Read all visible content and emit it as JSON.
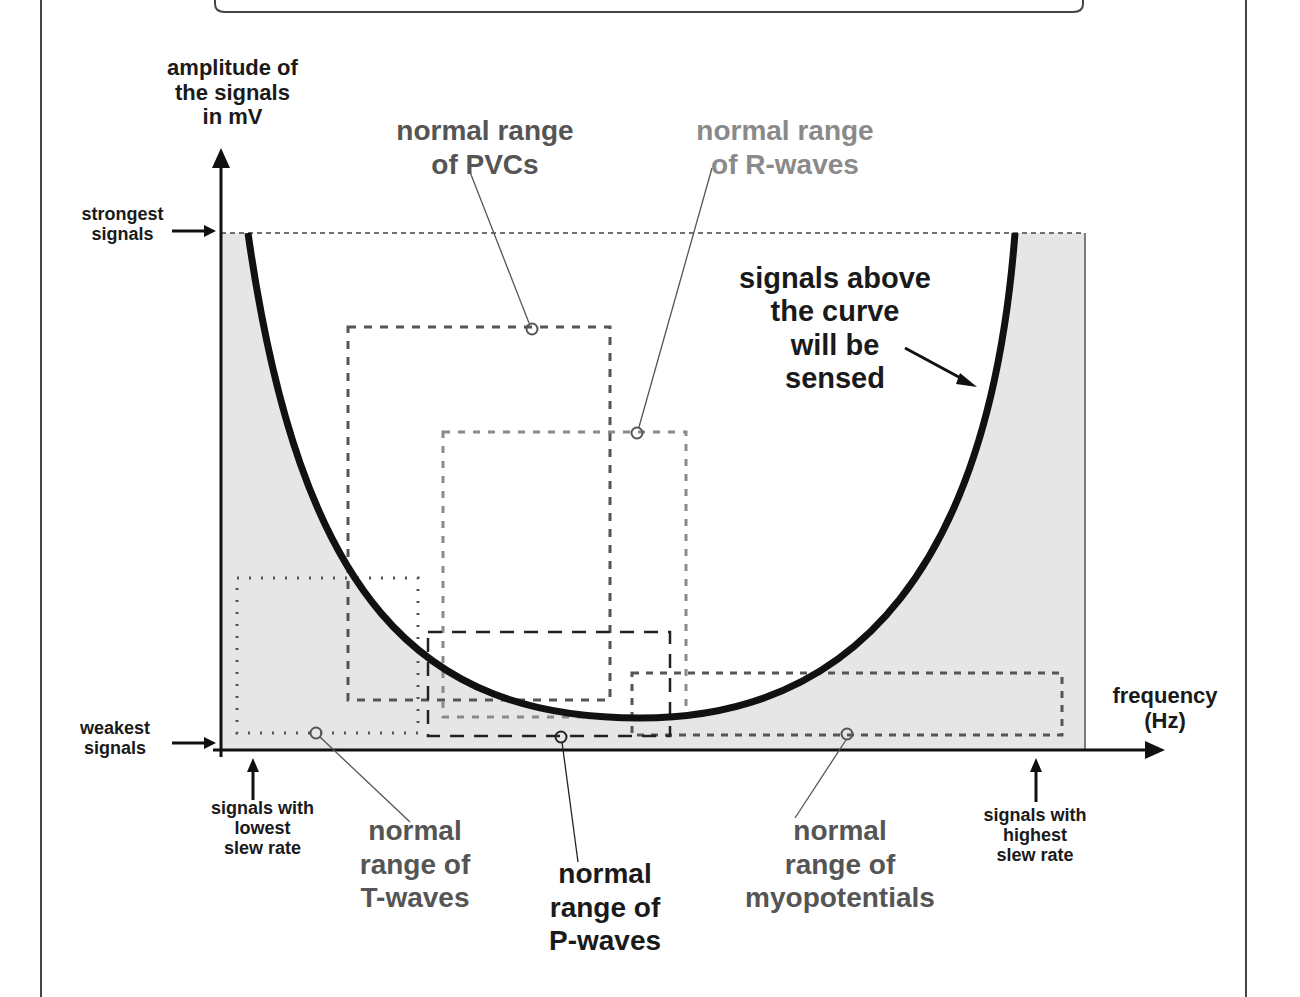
{
  "diagram": {
    "type": "sensing-threshold-diagram",
    "y_axis": {
      "label": "amplitude of\nthe signals\nin mV",
      "top_marker": "strongest\nsignals",
      "bottom_marker": "weakest\nsignals"
    },
    "x_axis": {
      "label": "frequency\n(Hz)",
      "left_marker": "signals with\nlowest\nslew rate",
      "right_marker": "signals with\nhighest\nslew rate"
    },
    "curve_annotation": "signals above\nthe curve\nwill be\nsensed",
    "ranges": [
      {
        "id": "pvc",
        "label": "normal range\nof PVCs",
        "style": "dash-dot",
        "color": "#555555"
      },
      {
        "id": "r-wave",
        "label": "normal range\nof R-waves",
        "style": "dashed-light",
        "color": "#8a8a8a"
      },
      {
        "id": "t-wave",
        "label": "normal\nrange of\nT-waves",
        "style": "dotted",
        "color": "#555555"
      },
      {
        "id": "p-wave",
        "label": "normal\nrange of\nP-waves",
        "style": "dashed",
        "color": "#1a1a1a"
      },
      {
        "id": "myopotential",
        "label": "normal\nrange of\nmyopotentials",
        "style": "short-dashed",
        "color": "#555555"
      }
    ],
    "colors": {
      "fill_below_curve": "#e6e6e6",
      "curve": "#111111",
      "axis": "#111111"
    }
  }
}
